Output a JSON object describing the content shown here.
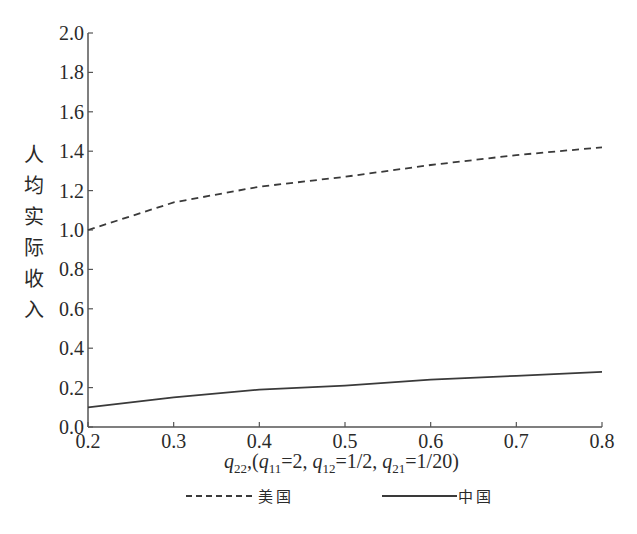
{
  "chart_data": {
    "type": "line",
    "title": "",
    "xlabel": "q22,(q11=2, q12=1/2, q21=1/20)",
    "ylabel": "人均实际收入",
    "x": [
      0.2,
      0.3,
      0.4,
      0.5,
      0.6,
      0.7,
      0.8
    ],
    "xlim": [
      0.2,
      0.8
    ],
    "ylim": [
      0.0,
      2.0
    ],
    "x_ticks": [
      "0.2",
      "0.3",
      "0.4",
      "0.5",
      "0.6",
      "0.7",
      "0.8"
    ],
    "y_ticks": [
      "0.0",
      "0.2",
      "0.4",
      "0.6",
      "0.8",
      "1.0",
      "1.2",
      "1.4",
      "1.6",
      "1.8",
      "2.0"
    ],
    "grid": false,
    "legend_position": "bottom",
    "series": [
      {
        "name": "美国",
        "style": "dashed",
        "values": [
          1.0,
          1.14,
          1.22,
          1.27,
          1.33,
          1.38,
          1.42
        ]
      },
      {
        "name": "中国",
        "style": "solid",
        "values": [
          0.1,
          0.15,
          0.19,
          0.21,
          0.24,
          0.26,
          0.28
        ]
      }
    ]
  },
  "axis": {
    "ylabel_chars": [
      "人",
      "均",
      "实",
      "际",
      "收",
      "入"
    ],
    "xlabel_parts": {
      "q22": "q",
      "q22_sub": "22",
      "sep": ",(",
      "q11": "q",
      "q11_sub": "11",
      "q11_val": "=2, ",
      "q12": "q",
      "q12_sub": "12",
      "q12_val": "=1/2, ",
      "q21": "q",
      "q21_sub": "21",
      "q21_val": "=1/20)"
    }
  },
  "legend": {
    "items": [
      {
        "label": "美国",
        "style": "dashed"
      },
      {
        "label": "中国",
        "style": "solid"
      }
    ]
  },
  "colors": {
    "line": "#3a3a3a",
    "axis": "#555555",
    "text": "#2a2a2a"
  }
}
